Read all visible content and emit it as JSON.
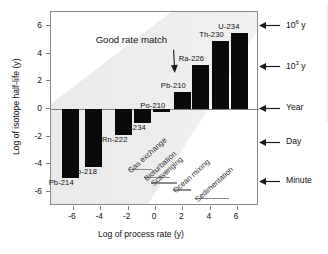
{
  "chart_data": {
    "type": "bar",
    "title": "",
    "xlabel": "Log of process rate (y)",
    "ylabel": "Log of isotope half-life (y)",
    "xlim": [
      -7.6,
      7.6
    ],
    "ylim": [
      -7.0,
      7.0
    ],
    "xticks": [
      "-6",
      "-4",
      "-2",
      "0",
      "2",
      "4",
      "6"
    ],
    "xtick_values": [
      -6,
      -4,
      -2,
      0,
      2,
      4,
      6
    ],
    "yticks": [
      "6",
      "4",
      "2",
      "0",
      "-2",
      "-4",
      "-6"
    ],
    "ytick_values": [
      6,
      4,
      2,
      0,
      -2,
      -4,
      -6
    ],
    "grid": false,
    "legend": "none",
    "bar_color": "#0a0a0a",
    "categories": [
      "Pb-214",
      "Po-218",
      "Rn-222",
      "Th-234",
      "Po-210",
      "Pb-210",
      "Ra-226",
      "Th-230",
      "U-234"
    ],
    "values": [
      -5.0,
      -4.2,
      -1.9,
      -1.0,
      -0.25,
      1.2,
      3.2,
      4.9,
      5.5
    ],
    "x": [
      -6.2,
      -4.5,
      -2.3,
      -0.9,
      0.5,
      2.0,
      3.3,
      4.8,
      6.2
    ],
    "bars": [
      {
        "label": "Pb-214",
        "x": -6.2,
        "value": -5.0,
        "label_pos": "below"
      },
      {
        "label": "Po-218",
        "x": -4.5,
        "value": -4.2,
        "label_pos": "below"
      },
      {
        "label": "Rn-222",
        "x": -2.3,
        "value": -1.9,
        "label_pos": "below"
      },
      {
        "label": "Th-234",
        "x": -0.9,
        "value": -1.0,
        "label_pos": "below"
      },
      {
        "label": "Po-210",
        "x": 0.5,
        "value": -0.25,
        "label_pos": "above"
      },
      {
        "label": "Pb-210",
        "x": 2.0,
        "value": 1.2,
        "label_pos": "above"
      },
      {
        "label": "Ra-226",
        "x": 3.3,
        "value": 3.2,
        "label_pos": "above"
      },
      {
        "label": "Th-230",
        "x": 4.8,
        "value": 4.9,
        "label_pos": "above"
      },
      {
        "label": "U-234",
        "x": 6.2,
        "value": 5.5,
        "label_pos": "above"
      }
    ],
    "right_axis": {
      "ticks": [
        {
          "label": "10{sup}6{/sup} y",
          "text": "10",
          "exponent": "6",
          "unit": " y",
          "value": 6.0
        },
        {
          "label": "10{sup}3{/sup} y",
          "text": "10",
          "exponent": "3",
          "unit": " y",
          "value": 3.0
        },
        {
          "label": "Year",
          "text": "Year",
          "exponent": "",
          "unit": "",
          "value": 0.0
        },
        {
          "label": "Day",
          "text": "Day",
          "exponent": "",
          "unit": "",
          "value": -2.45
        },
        {
          "label": "Minute",
          "text": "Minute",
          "exponent": "",
          "unit": "",
          "value": -5.3
        }
      ]
    },
    "process_bands": [
      {
        "label": "Gas exchange",
        "x_start": -2.0,
        "x_end": -0.2,
        "y": -4.3
      },
      {
        "label": "Bioturbation",
        "x_start": -0.8,
        "x_end": 1.1,
        "y": -4.9
      },
      {
        "label": "Scavenging",
        "x_start": -0.3,
        "x_end": 1.6,
        "y": -5.3
      },
      {
        "label": "Ocean mixing",
        "x_start": 1.3,
        "x_end": 2.6,
        "y": -5.8
      },
      {
        "label": "Sedimentation",
        "x_start": 2.9,
        "x_end": 5.4,
        "y": -6.4
      }
    ],
    "annotations": [
      {
        "text": "Good rate match",
        "x": -3.9,
        "y": 5.0,
        "arrow_to_x": 1.3,
        "arrow_to_y": 2.6
      }
    ]
  }
}
